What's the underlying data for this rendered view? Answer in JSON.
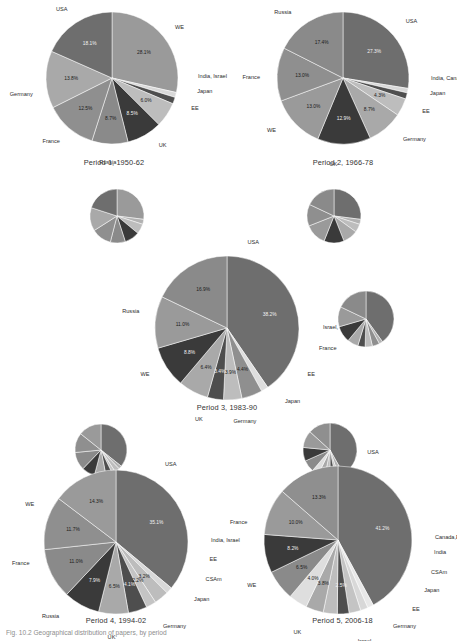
{
  "figure": {
    "caption": "Fig. 10.2  Geographical distribution of papers, by period",
    "background": "#ffffff"
  },
  "palette": {
    "usa": "#6e6e6e",
    "we": "#9a9a9a",
    "russia": "#8a8a8a",
    "france": "#8f8f8f",
    "germany": "#a9a9a9",
    "uk": "#3a3a3a",
    "ee": "#bdbdbd",
    "japan": "#4e4e4e",
    "india": "#d8d8d8",
    "israel": "#dedede",
    "canada": "#e8e8e8",
    "csam": "#c4c4c4",
    "outline": "#ffffff"
  },
  "chart_data": [
    {
      "id": "period1",
      "type": "pie",
      "title": "Period 1, 1950-62",
      "categories": [
        "WE",
        "India, Israel",
        "Japan",
        "EE",
        "UK",
        "Russia",
        "France",
        "Germany",
        "USA"
      ],
      "values": [
        28.1,
        1.2,
        1.6,
        6.0,
        8.5,
        8.7,
        12.5,
        13.8,
        18.1
      ],
      "labels": [
        "WE",
        "India, Israel",
        "Japan",
        "EE",
        "UK",
        "Russia",
        "France",
        "Germany",
        "USA"
      ],
      "shown_pct": [
        "28.1%",
        "",
        "",
        "6.0%",
        "8.5%",
        "8.7%",
        "12.5%",
        "13.8%",
        "18.1%"
      ],
      "radius": 66
    },
    {
      "id": "period1b",
      "type": "pie",
      "title": "",
      "categories": [
        "WE",
        "small",
        "EE",
        "UK",
        "Russia",
        "France",
        "Germany",
        "USA"
      ],
      "values": [
        27.0,
        3.0,
        6.0,
        9.0,
        9.0,
        12.0,
        14.0,
        20.0
      ],
      "labels": [],
      "shown_pct": [],
      "radius": 27
    },
    {
      "id": "period2",
      "type": "pie",
      "title": "Period 2, 1966-78",
      "categories": [
        "USA",
        "India, Canada",
        "Japan",
        "EE",
        "Germany",
        "UK",
        "WE",
        "France",
        "Russia"
      ],
      "values": [
        27.3,
        1.1,
        1.5,
        4.3,
        8.7,
        12.9,
        13.0,
        13.0,
        17.4
      ],
      "labels": [
        "USA",
        "India, Canada",
        "Japan",
        "EE",
        "Germany",
        "UK",
        "WE",
        "France",
        "Russia"
      ],
      "shown_pct": [
        "27.3%",
        "",
        "",
        "4.3%",
        "8.7%",
        "12.9%",
        "13.0%",
        "13.0%",
        "17.4%"
      ],
      "radius": 66
    },
    {
      "id": "period2b",
      "type": "pie",
      "title": "",
      "categories": [
        "USA",
        "small",
        "EE",
        "Germany",
        "UK",
        "WE",
        "France",
        "Russia"
      ],
      "values": [
        27.0,
        3.0,
        5.0,
        9.0,
        12.0,
        13.0,
        13.0,
        18.0
      ],
      "labels": [],
      "shown_pct": [],
      "radius": 27
    },
    {
      "id": "period3",
      "type": "pie",
      "title": "Period 3, 1983-90",
      "categories": [
        "USA",
        "Israel, India",
        "France",
        "EE",
        "Japan",
        "Germany",
        "UK",
        "WE",
        "Russia"
      ],
      "values": [
        38.2,
        1.5,
        4.4,
        3.9,
        3.4,
        6.4,
        8.8,
        11.0,
        16.9
      ],
      "labels": [
        "USA",
        "Israel, India",
        "France",
        "EE",
        "Japan",
        "Germany",
        "UK",
        "WE",
        "Russia"
      ],
      "shown_pct": [
        "38.2%",
        "",
        "4.4%",
        "3.9%",
        "3.4%",
        "6.4%",
        "8.8%",
        "11.0%",
        "16.9%"
      ],
      "radius": 72
    },
    {
      "id": "period3b",
      "type": "pie",
      "title": "",
      "categories": [
        "USA",
        "small",
        "France",
        "EE",
        "Japan",
        "Germany",
        "UK",
        "WE",
        "Russia"
      ],
      "values": [
        38.0,
        2.0,
        4.0,
        4.0,
        4.0,
        6.0,
        9.0,
        11.0,
        17.0
      ],
      "labels": [],
      "shown_pct": [],
      "radius": 28
    },
    {
      "id": "period4",
      "type": "pie",
      "title": "Period 4, 1994-02",
      "categories": [
        "USA",
        "India, Israel",
        "EE",
        "CSAm",
        "Japan",
        "Germany",
        "UK",
        "Russia",
        "France",
        "WE"
      ],
      "values": [
        35.1,
        1.4,
        3.2,
        2.2,
        4.1,
        6.5,
        7.9,
        11.0,
        11.7,
        14.3
      ],
      "labels": [
        "USA",
        "India, Israel",
        "EE",
        "CSAm",
        "Japan",
        "Germany",
        "UK",
        "Russia",
        "France",
        "WE"
      ],
      "shown_pct": [
        "35.1%",
        "",
        "3.2%",
        "2.2%",
        "4.1%",
        "6.5%",
        "7.9%",
        "11.0%",
        "11.7%",
        "14.3%"
      ],
      "radius": 72
    },
    {
      "id": "period4b",
      "type": "pie",
      "title": "",
      "categories": [
        "USA",
        "small",
        "EE",
        "CSAm",
        "Japan",
        "Germany",
        "UK",
        "Russia",
        "France",
        "WE"
      ],
      "values": [
        35.0,
        2.0,
        3.0,
        2.0,
        4.0,
        7.0,
        8.0,
        11.0,
        12.0,
        14.0
      ],
      "labels": [],
      "shown_pct": [],
      "radius": 26
    },
    {
      "id": "period5",
      "type": "pie",
      "title": "Period 5, 2006-18",
      "categories": [
        "USA",
        "Canada,EA",
        "India",
        "CSAm",
        "Japan",
        "EE",
        "Germany",
        "Israel",
        "Russia",
        "UK",
        "WE",
        "France"
      ],
      "values": [
        41.2,
        1.3,
        1.6,
        2.5,
        2.5,
        3.0,
        3.8,
        4.0,
        6.5,
        8.2,
        10.0,
        13.3
      ],
      "labels": [
        "USA",
        "Canada,EA",
        "India",
        "CSAm",
        "Japan",
        "EE",
        "Germany",
        "Israel",
        "Russia",
        "UK",
        "WE",
        "France"
      ],
      "shown_pct": [
        "41.2%",
        "",
        "",
        "",
        "2.5%",
        "",
        "3.8%",
        "4.0%",
        "6.5%",
        "8.2%",
        "10.0%",
        "13.3%"
      ],
      "radius": 74
    },
    {
      "id": "period5b",
      "type": "pie",
      "title": "",
      "categories": [
        "USA",
        "small",
        "CSAm",
        "Japan",
        "EE",
        "Germany",
        "Israel",
        "Russia",
        "UK",
        "WE",
        "France"
      ],
      "values": [
        41.0,
        3.0,
        2.0,
        3.0,
        3.0,
        4.0,
        4.0,
        7.0,
        8.0,
        10.0,
        13.0
      ],
      "labels": [],
      "shown_pct": [],
      "radius": 27
    }
  ],
  "captions": {
    "period1": "Period 1, 1950-62",
    "period2": "Period 2, 1966-78",
    "period3": "Period 3, 1983-90",
    "period4": "Period 4, 1994-02",
    "period5": "Period 5, 2006-18"
  }
}
